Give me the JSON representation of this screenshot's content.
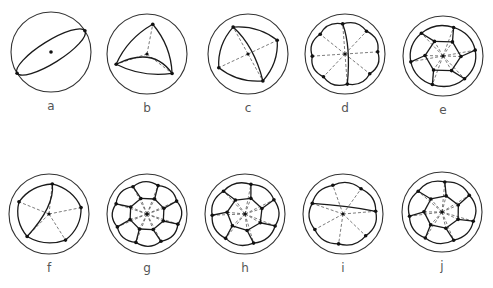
{
  "figure": {
    "panels": [
      {
        "label": "a",
        "vertices": 2
      },
      {
        "label": "b",
        "vertices": 3
      },
      {
        "label": "c",
        "vertices": 4
      },
      {
        "label": "d",
        "vertices": 8
      },
      {
        "label": "e",
        "vertices": 12
      },
      {
        "label": "f",
        "vertices": 5
      },
      {
        "label": "g",
        "vertices": 16
      },
      {
        "label": "h",
        "vertices": 14
      },
      {
        "label": "i",
        "vertices": 7
      },
      {
        "label": "j",
        "vertices": 14
      }
    ]
  }
}
